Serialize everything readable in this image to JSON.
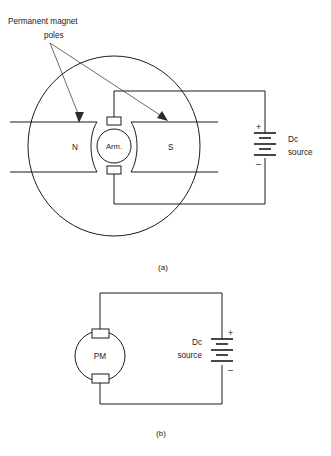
{
  "figure": {
    "title_text": "Permanent magnet dc motor diagrams",
    "annotation": {
      "line1": "Permanent magnet",
      "line2": "poles"
    },
    "panel_a": {
      "caption": "(a)",
      "north_pole_label": "N",
      "south_pole_label": "S",
      "armature_label": "Arm.",
      "source_line1": "Dc",
      "source_line2": "source",
      "plus_sign": "+",
      "minus_sign": "–"
    },
    "panel_b": {
      "caption": "(b)",
      "motor_label": "PM",
      "source_line1": "Dc",
      "source_line2": "source",
      "plus_sign": "+",
      "minus_sign": "–"
    },
    "colors": {
      "ink": "#1a1a1a",
      "background": "#ffffff",
      "leader": "#2b2b2b"
    }
  }
}
